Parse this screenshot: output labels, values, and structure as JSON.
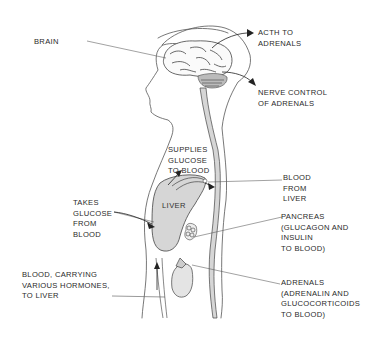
{
  "diagram": {
    "colors": {
      "line": "#555555",
      "organ_fill": "#d6d6d6",
      "text": "#2a2a2a",
      "background": "#ffffff"
    },
    "labels": {
      "brain": [
        "BRAIN"
      ],
      "acth": [
        "ACTH TO",
        "ADRENALS"
      ],
      "nerve": [
        "NERVE CONTROL",
        "OF ADRENALS"
      ],
      "supplies": [
        "SUPPLIES",
        "GLUCOSE",
        "TO BLOOD"
      ],
      "takes": [
        "TAKES",
        "GLUCOSE",
        "FROM",
        "BLOOD"
      ],
      "liver_organ": "LIVER",
      "blood_from_liver": [
        "BLOOD",
        "FROM",
        "LIVER"
      ],
      "pancreas": [
        "PANCREAS",
        "(GLUCAGON AND",
        "INSULIN",
        "TO BLOOD)"
      ],
      "blood_carrying": [
        "BLOOD, CARRYING",
        "VARIOUS HORMONES,",
        "TO LIVER"
      ],
      "adrenals": [
        "ADRENALS",
        "(ADRENALIN AND",
        "GLUCOCORTICOIDS",
        "TO BLOOD)"
      ]
    }
  }
}
